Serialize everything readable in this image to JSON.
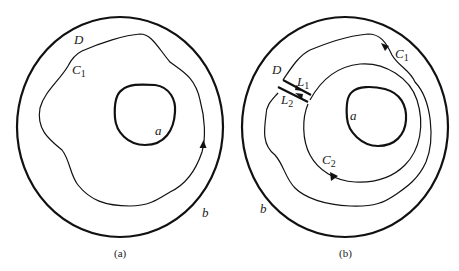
{
  "figure": {
    "panels": [
      {
        "id": "a",
        "caption": "(a)",
        "labels": {
          "region": "D",
          "contour": "C",
          "contour_sub": "1",
          "inner_boundary": "a",
          "outer_boundary": "b"
        }
      },
      {
        "id": "b",
        "caption": "(b)",
        "labels": {
          "region": "D",
          "contour_outer": "C",
          "contour_outer_sub": "1",
          "contour_inner": "C",
          "contour_inner_sub": "2",
          "line_1": "L",
          "line_1_sub": "1",
          "line_2": "L",
          "line_2_sub": "2",
          "inner_boundary": "a",
          "outer_boundary": "b"
        }
      }
    ],
    "colors": {
      "stroke": "#111111",
      "background": "#ffffff"
    }
  }
}
